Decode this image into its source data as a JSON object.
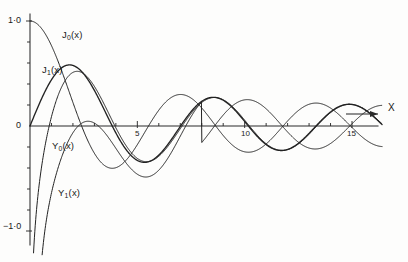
{
  "chart_data": {
    "type": "line",
    "title": "",
    "xlabel": "x",
    "ylabel": "",
    "xlim": [
      0,
      17.5
    ],
    "ylim": [
      -1.22,
      1.05
    ],
    "grid": false,
    "legend_position": "inline-curve-labels",
    "x_tick_labels": [
      "5",
      "10",
      "15"
    ],
    "x_tick_values": [
      5,
      10,
      15
    ],
    "x_minor_tick_step": 1,
    "y_tick_labels": [
      "1·0",
      "0",
      "−1·0"
    ],
    "y_tick_values": [
      1,
      0,
      -1
    ],
    "y_minor_tick_step": 0.2,
    "series": [
      {
        "name": "J0",
        "label": "J",
        "label_sub": "0",
        "label_suffix": "(x)",
        "kind": "besselJ",
        "order": 0,
        "weight": "normal",
        "label_x": 62,
        "label_y": 30
      },
      {
        "name": "J1",
        "label": "J",
        "label_sub": "1",
        "label_suffix": "(x)",
        "kind": "besselJ",
        "order": 1,
        "weight": "heavy",
        "label_x": 42,
        "label_y": 65
      },
      {
        "name": "Y0",
        "label": "Y",
        "label_sub": "0",
        "label_suffix": "(x)",
        "kind": "besselY",
        "order": 0,
        "weight": "normal",
        "label_x": 52,
        "label_y": 141
      },
      {
        "name": "Y1",
        "label": "Y",
        "label_sub": "1",
        "label_suffix": "(x)",
        "kind": "besselY",
        "order": 1,
        "weight": "normal",
        "label_x": 58,
        "label_y": 188
      }
    ],
    "annotations": [
      {
        "name": "x-axis-arrow-label",
        "text": "X",
        "x": 388,
        "y": 108
      }
    ]
  },
  "axis": {
    "y_top_label": "1·0",
    "y_zero_label": "0",
    "y_bottom_label": "−1·0",
    "x_label_5": "5",
    "x_label_10": "10",
    "x_label_15": "15",
    "x_axis_name": "X"
  },
  "labels": {
    "j0": "J₀(x)",
    "j1": "J₁(x)",
    "y0": "Y₀(x)",
    "y1": "Y₁(x)"
  }
}
